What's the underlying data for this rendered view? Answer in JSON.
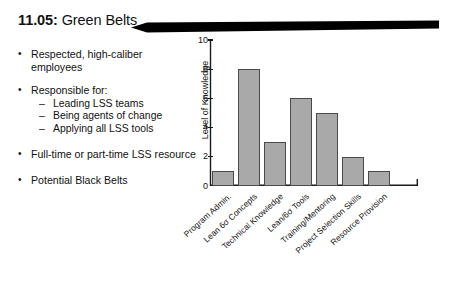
{
  "slide": {
    "number": "11.05:",
    "title": "Green Belts"
  },
  "bullets": [
    {
      "text": "Respected, high-caliber employees",
      "subs": []
    },
    {
      "text": "Responsible for:",
      "subs": [
        "Leading LSS teams",
        "Being agents of change",
        "Applying all LSS tools"
      ]
    },
    {
      "text": "Full-time or part-time LSS resource",
      "subs": []
    },
    {
      "text": "Potential Black Belts",
      "subs": []
    }
  ],
  "markers": {
    "bullet_glyph": "•",
    "sub_dash_glyph": "–"
  },
  "chart_data": {
    "type": "bar",
    "title": "",
    "xlabel": "",
    "ylabel": "Level of Knowledge",
    "categories": [
      "Program Admin.",
      "Lean 6σ Concepts",
      "Technical Knowledge",
      "Lean/6σ Tools",
      "Training/Mentoring",
      "Project Selection Skills",
      "Resource Provision"
    ],
    "values": [
      1,
      8,
      3,
      6,
      5,
      2,
      1
    ],
    "ylim": [
      0,
      10
    ],
    "yticks": [
      0,
      2,
      4,
      6,
      8,
      10
    ],
    "ytick_labels": [
      "0",
      "2",
      "4",
      "6",
      "8",
      "10"
    ],
    "grid": false,
    "legend": "none",
    "bar_fill": "#a9a9a9",
    "bar_edge": "#4a4a4a",
    "axis_color": "#1a1a1a"
  }
}
